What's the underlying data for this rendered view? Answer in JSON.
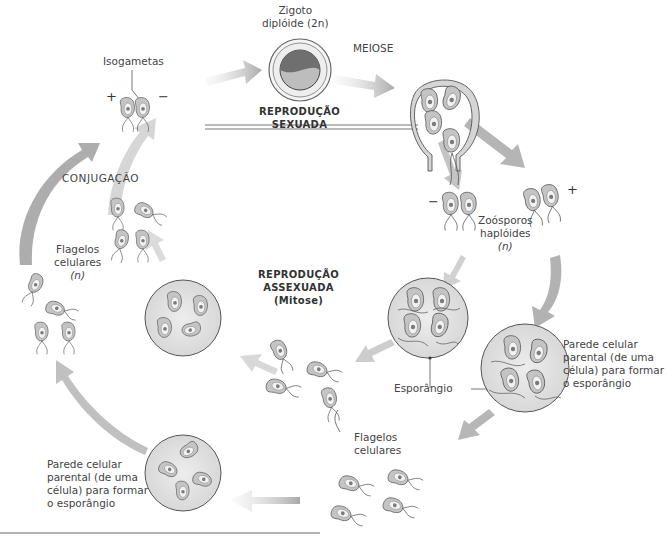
{
  "title_sexual": [
    "REPRODUÇÃO",
    "SEXUADA"
  ],
  "title_asexual": [
    "REPRODUÇÃO",
    "ASSEXUADA",
    "(Mitose)"
  ],
  "labels": {
    "zygote": [
      "Zigoto",
      "diplóide (2n)"
    ],
    "meiosis": "MEIOSE",
    "isogametes": "Isogametas",
    "conjugation": "CONJUGAÇÃO",
    "flagellated_cells_left": [
      "Flagelos",
      "celulares",
      "(n)"
    ],
    "zoospores": [
      "Zoósporos",
      "haplóides",
      "(n)"
    ],
    "sporangium": "Esporângio",
    "parent_wall_right": [
      "Parede celular",
      "parental (de uma",
      "célula) para formar",
      "o esporângio"
    ],
    "parent_wall_bottom": [
      "Parede celular",
      "parental (de uma",
      "célula) para formar",
      "o esporângio"
    ],
    "flagellated_cells_bottom": [
      "Flagelos",
      "celulares"
    ]
  },
  "signs": {
    "isogamete_plus": "+",
    "isogamete_minus": "−",
    "zoospore_minus": "−",
    "zoospore_plus": "+"
  },
  "colors": {
    "arrow": "#b8b8b8",
    "cell_fill": "#c9c9c9",
    "cell_inner": "#efefef",
    "nucleus": "#777777",
    "outline": "#555555",
    "circle_fill": "#e6e6e6"
  }
}
